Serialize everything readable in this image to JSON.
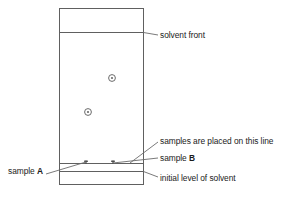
{
  "figure": {
    "name": "paper-chromatography-diagram",
    "line_color": "#555555",
    "text_color": "#1a1a1a",
    "background": "#ffffff"
  },
  "labels": {
    "solvent_front": "solvent front",
    "samples_placed_line": "samples are placed on this line",
    "sample_b_prefix": "sample ",
    "sample_b_letter": "B",
    "initial_level": "initial level of solvent",
    "sample_a_prefix": "sample ",
    "sample_a_letter": "A"
  },
  "geometry": {
    "chamber": {
      "x": 59,
      "y": 8,
      "width": 85,
      "height": 177
    },
    "solvent_front_line_y": 32,
    "baseline_y": 163,
    "initial_solvent_line_y": 171,
    "spots": [
      {
        "name": "spot-sample-a",
        "cx": 88,
        "cy": 112,
        "r": 3.4
      },
      {
        "name": "spot-sample-b",
        "cx": 112,
        "cy": 78,
        "r": 3.4
      }
    ],
    "origin_marks": [
      {
        "name": "origin-mark-sample-a",
        "cx": 86,
        "cy": 163
      },
      {
        "name": "origin-mark-sample-b",
        "cx": 113,
        "cy": 163
      }
    ]
  }
}
